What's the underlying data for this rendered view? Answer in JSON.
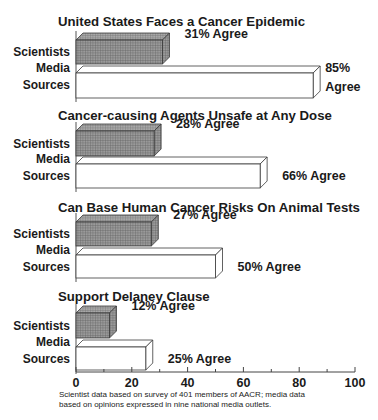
{
  "chart_data": {
    "type": "bar",
    "orientation": "horizontal",
    "style": "3d",
    "xlim": [
      0,
      100
    ],
    "xticks": [
      0,
      20,
      40,
      60,
      80,
      100
    ],
    "grid": false,
    "legend": "none",
    "series_names": [
      "Scientists",
      "Media Sources"
    ],
    "series_labels": [
      [
        "Scientists"
      ],
      [
        "Media",
        "Sources"
      ]
    ],
    "colors": {
      "scientists": "#8a8a8a",
      "media": "#ffffff",
      "outline": "#444444"
    },
    "panels": [
      {
        "title": "United States Faces a Cancer Epidemic",
        "values": [
          31,
          85
        ],
        "value_labels": [
          [
            "31% Agree"
          ],
          [
            "85%",
            "Agree"
          ]
        ]
      },
      {
        "title": "Cancer-causing Agents Unsafe at Any Dose",
        "values": [
          28,
          66
        ],
        "value_labels": [
          [
            "28% Agree"
          ],
          [
            "66% Agree"
          ]
        ]
      },
      {
        "title": "Can Base Human Cancer Risks On Animal Tests",
        "values": [
          27,
          50
        ],
        "value_labels": [
          [
            "27% Agree"
          ],
          [
            "50% Agree"
          ]
        ]
      },
      {
        "title": "Support Delaney Clause",
        "values": [
          12,
          25
        ],
        "value_labels": [
          [
            "12% Agree"
          ],
          [
            "25% Agree"
          ]
        ]
      }
    ],
    "footnote": [
      "Scientist data based on survey of 401 members of AACR; media data",
      "based on opinions expressed in nine national media outlets."
    ]
  }
}
